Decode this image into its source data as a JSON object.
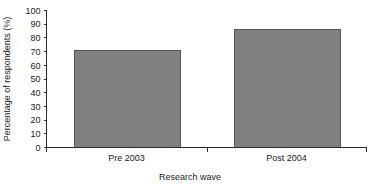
{
  "chart_data": {
    "type": "bar",
    "title": "",
    "subtitle": "",
    "categories": [
      "Pre 2003",
      "Post 2004"
    ],
    "values": [
      71,
      86
    ],
    "xlabel": "Research wave",
    "ylabel": "Percentage of respondents (%)",
    "ylim": [
      0,
      100
    ],
    "yticks": [
      0,
      10,
      20,
      30,
      40,
      50,
      60,
      70,
      80,
      90,
      100
    ],
    "ytick_labels": [
      "0",
      "10",
      "20",
      "30",
      "40",
      "50",
      "60",
      "70",
      "80",
      "90",
      "100"
    ],
    "grid": false,
    "legend": false,
    "legend_position": "none",
    "annotations": [],
    "bar_color": "#808080",
    "bar_edge_color": "#555555",
    "axis_color": "#2b2b2b",
    "background_color": "#ffffff"
  }
}
